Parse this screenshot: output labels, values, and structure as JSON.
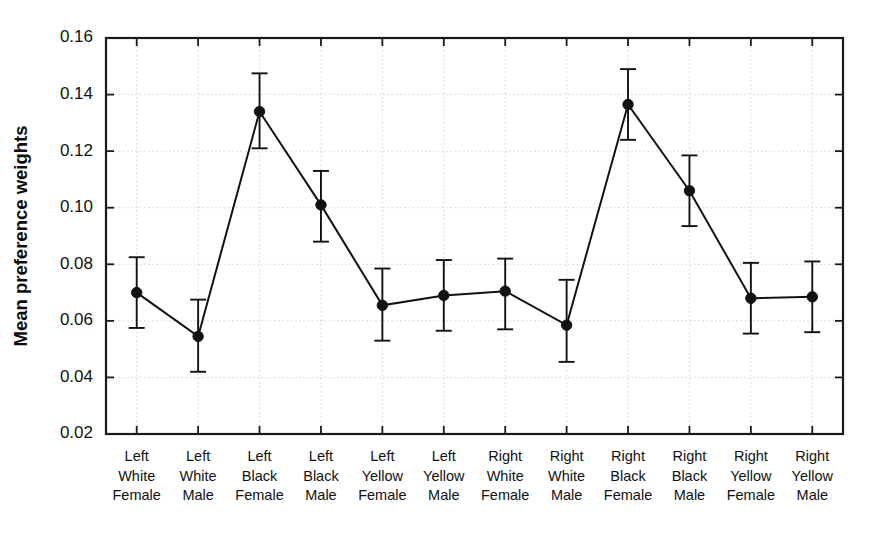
{
  "chart_data": {
    "type": "line",
    "title": "",
    "subtitle": "",
    "xlabel": "",
    "ylabel": "Mean preference weights",
    "ylim": [
      0.02,
      0.16
    ],
    "yticks": [
      0.02,
      0.04,
      0.06,
      0.08,
      0.1,
      0.12,
      0.14,
      0.16
    ],
    "ytick_labels": [
      "0.02",
      "0.04",
      "0.06",
      "0.08",
      "0.10",
      "0.12",
      "0.14",
      "0.16"
    ],
    "grid": true,
    "grid_axis": "both",
    "legend": null,
    "legend_position": "none",
    "marker": "filled-circle",
    "error_bars": "vertical-with-caps",
    "categories": [
      "Left\nWhite\nFemale",
      "Left\nWhite\nMale",
      "Left\nBlack\nFemale",
      "Left\nBlack\nMale",
      "Left\nYellow\nFemale",
      "Left\nYellow\nMale",
      "Right\nWhite\nFemale",
      "Right\nWhite\nMale",
      "Right\nBlack\nFemale",
      "Right\nBlack\nMale",
      "Right\nYellow\nFemale",
      "Right\nYellow\nMale"
    ],
    "category_lines": [
      [
        "Left",
        "White",
        "Female"
      ],
      [
        "Left",
        "White",
        "Male"
      ],
      [
        "Left",
        "Black",
        "Female"
      ],
      [
        "Left",
        "Black",
        "Male"
      ],
      [
        "Left",
        "Yellow",
        "Female"
      ],
      [
        "Left",
        "Yellow",
        "Male"
      ],
      [
        "Right",
        "White",
        "Female"
      ],
      [
        "Right",
        "White",
        "Male"
      ],
      [
        "Right",
        "Black",
        "Female"
      ],
      [
        "Right",
        "Black",
        "Male"
      ],
      [
        "Right",
        "Yellow",
        "Female"
      ],
      [
        "Right",
        "Yellow",
        "Male"
      ]
    ],
    "values": [
      0.07,
      0.0545,
      0.134,
      0.101,
      0.0655,
      0.069,
      0.0705,
      0.0585,
      0.1365,
      0.106,
      0.068,
      0.0685
    ],
    "error_low": [
      0.0575,
      0.042,
      0.121,
      0.088,
      0.053,
      0.0565,
      0.057,
      0.0455,
      0.124,
      0.0935,
      0.0555,
      0.056
    ],
    "error_high": [
      0.0825,
      0.0675,
      0.1475,
      0.113,
      0.0785,
      0.0815,
      0.082,
      0.0745,
      0.149,
      0.1185,
      0.0805,
      0.081
    ],
    "colors": {
      "line": "#121212",
      "marker": "#121212",
      "error_bar": "#121212",
      "grid": "#c9c9c9",
      "axis": "#1a1a1a",
      "background": "#ffffff"
    }
  }
}
